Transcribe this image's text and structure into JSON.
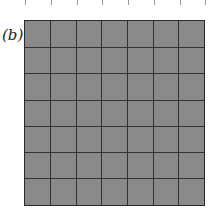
{
  "figure": {
    "label": "(b)",
    "grid": {
      "rows": 7,
      "cols": 7,
      "fill_color": "#8a8a8a",
      "line_color": "#333333"
    },
    "top_ticks": 8
  }
}
